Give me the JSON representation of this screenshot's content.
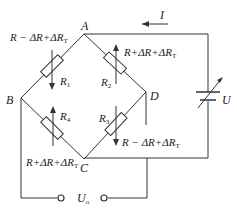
{
  "diagram": {
    "type": "wheatstone-bridge",
    "nodes": {
      "A": "A",
      "B": "B",
      "C": "C",
      "D": "D"
    },
    "current_label": "I",
    "source_label": "U",
    "output_label_main": "U",
    "output_label_sub": "o",
    "resistors": [
      {
        "id": "R1",
        "name_main": "R",
        "name_sub": "1",
        "value_label": "R − ΔR+ΔR",
        "value_sub": "T",
        "arrow": "down"
      },
      {
        "id": "R2",
        "name_main": "R",
        "name_sub": "2",
        "value_label": "R+ΔR+ΔR",
        "value_sub": "T",
        "arrow": "up"
      },
      {
        "id": "R3",
        "name_main": "R",
        "name_sub": "3",
        "value_label": "R − ΔR+ΔR",
        "value_sub": "T",
        "arrow": "down"
      },
      {
        "id": "R4",
        "name_main": "R",
        "name_sub": "4",
        "value_label": "R+ΔR+ΔR",
        "value_sub": "T",
        "arrow": "up"
      }
    ],
    "colors": {
      "line": "#333333",
      "background": "#ffffff"
    }
  }
}
